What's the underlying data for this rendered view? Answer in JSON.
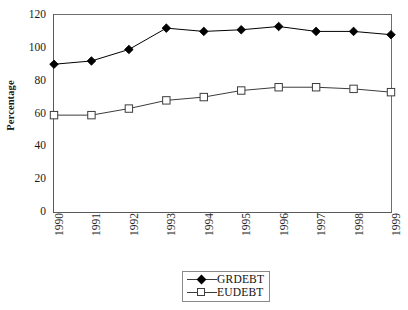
{
  "chart_data": {
    "type": "line",
    "title": "",
    "subtitle": "",
    "xlabel": "",
    "ylabel": "Percentage",
    "categories": [
      "1990",
      "1991",
      "1992",
      "1993",
      "1994",
      "1995",
      "1996",
      "1997",
      "1998",
      "1999"
    ],
    "x": [
      1990,
      1991,
      1992,
      1993,
      1994,
      1995,
      1996,
      1997,
      1998,
      1999
    ],
    "series": [
      {
        "name": "GRDEBT",
        "marker": "filled-diamond",
        "color": "#000000",
        "values": [
          90,
          92,
          99,
          112,
          110,
          111,
          113,
          110,
          110,
          108
        ]
      },
      {
        "name": "EUDEBT",
        "marker": "open-square",
        "color": "#3c3c3c",
        "values": [
          59,
          59,
          63,
          68,
          70,
          74,
          76,
          76,
          75,
          73
        ]
      }
    ],
    "ylim": [
      0,
      120
    ],
    "yticks": [
      0,
      20,
      40,
      60,
      80,
      100,
      120
    ],
    "ytick_labels": [
      "0",
      "20",
      "40",
      "60",
      "80",
      "100",
      "120"
    ],
    "xlim": [
      1990,
      1999
    ],
    "grid": false,
    "legend_position": "bottom-center",
    "legend_entries": [
      "GRDEBT",
      "EUDEBT"
    ],
    "annotations": []
  },
  "axis": {
    "y_title": "Percentage"
  },
  "legend": {
    "rows": [
      {
        "label": "GRDEBT",
        "marker": "filled-diamond-icon"
      },
      {
        "label": "EUDEBT",
        "marker": "open-square-icon"
      }
    ]
  }
}
